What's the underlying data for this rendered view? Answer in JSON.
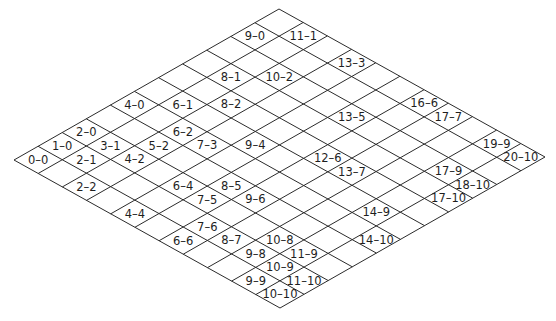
{
  "diagram": {
    "grid": {
      "rows": 11,
      "cols": 11
    },
    "line_color": "#2b2b2b",
    "text_color": "#1e1e1e",
    "background": "#ffffff",
    "cells": [
      {
        "label": "0–0"
      },
      {
        "label": "1–0"
      },
      {
        "label": "2–0"
      },
      {
        "label": "4–0"
      },
      {
        "label": "9–0"
      },
      {
        "label": "2–1"
      },
      {
        "label": "3–1"
      },
      {
        "label": "6–1"
      },
      {
        "label": "8–1"
      },
      {
        "label": "11–1"
      },
      {
        "label": "2–2"
      },
      {
        "label": "4–2"
      },
      {
        "label": "5–2"
      },
      {
        "label": "6–2"
      },
      {
        "label": "8–2"
      },
      {
        "label": "10–2"
      },
      {
        "label": "7–3"
      },
      {
        "label": "13–3"
      },
      {
        "label": "4–4"
      },
      {
        "label": "6–4"
      },
      {
        "label": "9–4"
      },
      {
        "label": "7–5"
      },
      {
        "label": "8–5"
      },
      {
        "label": "13–5"
      },
      {
        "label": "6–6"
      },
      {
        "label": "9–6"
      },
      {
        "label": "12–6"
      },
      {
        "label": "16–6"
      },
      {
        "label": "7–6"
      },
      {
        "label": "8–7"
      },
      {
        "label": "13–7"
      },
      {
        "label": "17–7"
      },
      {
        "label": "9–8"
      },
      {
        "label": "10–8"
      },
      {
        "label": "9–9"
      },
      {
        "label": "10–9"
      },
      {
        "label": "11–9"
      },
      {
        "label": "14–9"
      },
      {
        "label": "17–9"
      },
      {
        "label": "19–9"
      },
      {
        "label": "10–10"
      },
      {
        "label": "11–10"
      },
      {
        "label": "14–10"
      },
      {
        "label": "17–10"
      },
      {
        "label": "18–10"
      },
      {
        "label": "20–10"
      }
    ]
  }
}
